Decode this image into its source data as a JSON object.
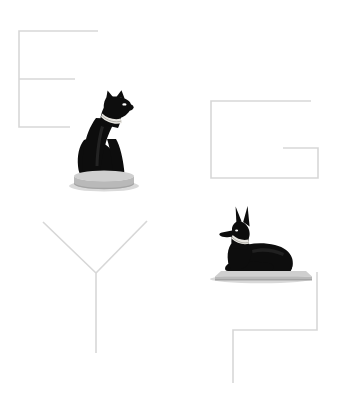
{
  "canvas": {
    "width": 340,
    "height": 405,
    "background_color": "#ffffff",
    "stroke_color": "#d7d7d7"
  },
  "composition": {
    "description": "Four thin light-gray outline letterforms arranged on a white field with two black Egyptian statuettes resting on pale stone bases.",
    "letters": [
      {
        "glyph": "E",
        "name": "letter-e",
        "quadrant": "top-left",
        "stroke_color": "#d7d7d7",
        "bbox": [
          18,
          30,
          80,
          97
        ],
        "path": "M 98 31 L 19 31 L 19 127 L 70 127 M 19 79 L 75 79"
      },
      {
        "glyph": "G",
        "name": "letter-g",
        "quadrant": "middle-right",
        "stroke_color": "#d7d7d7",
        "bbox": [
          210,
          100,
          108,
          78
        ],
        "path": "M 311 101 L 211 101 L 211 178 L 318 178 L 318 148 L 283 148"
      },
      {
        "glyph": "Y",
        "name": "letter-y",
        "quadrant": "bottom-left",
        "stroke_color": "#d7d7d7",
        "bbox": [
          43,
          221,
          105,
          132
        ],
        "path": "M 43 222 L 96 273 L 96 353 M 147 221 L 96 273"
      },
      {
        "glyph": "P",
        "name": "letter-p",
        "quadrant": "bottom-right",
        "stroke_color": "#d7d7d7",
        "bbox": [
          233,
          272,
          85,
          111
        ],
        "path": "M 317 272 L 317 330 L 233 330 L 233 383"
      }
    ],
    "statues": [
      {
        "name": "cat-statue-bastet",
        "subject": "seated Egyptian cat (Bastet)",
        "material_color": "#0d0d0d",
        "collar_color": "#e8e6e1",
        "base_color": "#b9b9b9",
        "position": [
          72,
          90
        ],
        "size": [
          64,
          100
        ],
        "facing": "right"
      },
      {
        "name": "jackal-statue-anubis",
        "subject": "recumbent Egyptian jackal (Anubis)",
        "material_color": "#0d0d0d",
        "collar_color": "#e8e6e1",
        "base_color": "#b9b9b9",
        "position": [
          212,
          204
        ],
        "size": [
          98,
          76
        ],
        "facing": "left"
      }
    ]
  }
}
